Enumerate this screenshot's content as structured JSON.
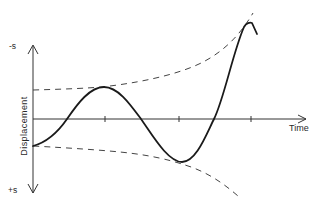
{
  "diagram": {
    "y_axis_label": "Displacement",
    "x_axis_label": "Time",
    "y_top_label": "-s",
    "y_bottom_label": "+s",
    "colors": {
      "line": "#1a1a1a",
      "axis": "#333333",
      "envelope": "#444444",
      "background": "#ffffff"
    },
    "elements": [
      {
        "id": "displacement-curve",
        "style": "solid",
        "description": "oscillation with growing amplitude"
      },
      {
        "id": "upper-envelope",
        "style": "dashed",
        "description": "increasing amplitude envelope (-s side)"
      },
      {
        "id": "lower-envelope",
        "style": "dashed",
        "description": "increasing amplitude envelope (+s side)"
      }
    ],
    "time_ticks": 3
  }
}
